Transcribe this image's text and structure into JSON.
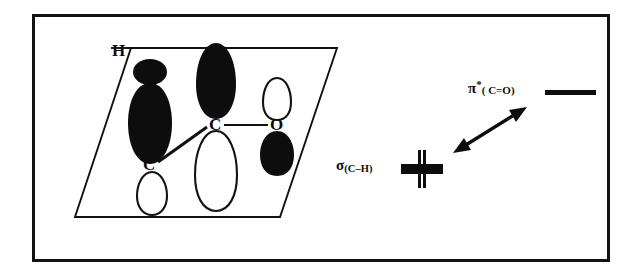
{
  "figure": {
    "domain_type": "chemistry-orbital-interaction-diagram",
    "frame": {
      "border_color": "#121212"
    },
    "background_color": "#ffffff",
    "ink_color": "#0d0d0d"
  },
  "molecular_fragment": {
    "plane_shape": "parallelogram",
    "atom_labels": [
      {
        "id": "h-top",
        "text": "H",
        "x": 112,
        "y": 42
      },
      {
        "id": "c-center",
        "text": "C",
        "x": 209,
        "y": 116
      },
      {
        "id": "c-lower",
        "text": "C",
        "x": 143,
        "y": 156
      },
      {
        "id": "o-right",
        "text": "O",
        "x": 270,
        "y": 116
      }
    ],
    "bonds": [
      {
        "id": "bond-h-plane",
        "from": "h-top",
        "to": "plane-edge",
        "style": "solid"
      },
      {
        "id": "bond-c-o",
        "from": "c-center",
        "to": "o-right",
        "style": "solid"
      },
      {
        "id": "bond-c-c",
        "from": "c-center",
        "to": "c-lower",
        "style": "solid-bold"
      }
    ],
    "orbital_lobes": [
      {
        "id": "lobe-h-small-top",
        "atom": "H",
        "fill": "black",
        "shape": "ellipse"
      },
      {
        "id": "lobe-h-large-lower",
        "atom": "H",
        "fill": "black",
        "shape": "teardrop"
      },
      {
        "id": "lobe-c-center-up",
        "atom": "C",
        "fill": "black",
        "shape": "teardrop"
      },
      {
        "id": "lobe-c-center-down",
        "atom": "C",
        "fill": "white",
        "shape": "teardrop"
      },
      {
        "id": "lobe-o-up",
        "atom": "O",
        "fill": "white",
        "shape": "teardrop"
      },
      {
        "id": "lobe-o-down",
        "atom": "O",
        "fill": "black",
        "shape": "teardrop"
      },
      {
        "id": "lobe-c-lower-down",
        "atom": "C",
        "fill": "white",
        "shape": "teardrop"
      }
    ]
  },
  "orbital_levels": {
    "sigma": {
      "symbol": "σ",
      "subscript": "(C–H)",
      "full_text": "σ(C–H)",
      "marker": "thick-bar-with-vertical-line"
    },
    "pi_star": {
      "symbol": "π",
      "superscript": "*",
      "subscript": "( C=O)",
      "full_text": "π*( C=O)",
      "marker": "thick-horizontal-bar"
    },
    "interaction_arrow": {
      "id": "interaction-arrow",
      "style": "double-headed",
      "direction": "lower-left-to-upper-right"
    }
  }
}
